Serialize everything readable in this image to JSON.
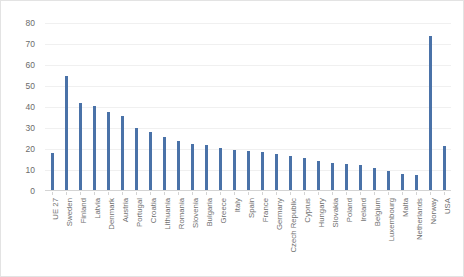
{
  "chart_data": {
    "type": "bar",
    "title": "",
    "subtitle": "",
    "xlabel": "",
    "ylabel": "",
    "ylim": [
      0,
      80
    ],
    "ytick_step": 10,
    "yticks": [
      "80",
      "70",
      "60",
      "50",
      "40",
      "30",
      "20",
      "10",
      "0"
    ],
    "grid": true,
    "legend": false,
    "bar_color": "#4a72a8",
    "gridline_color": "#f0f0f0",
    "axis_color": "#d4d4d4",
    "categories": [
      "UE 27",
      "Sweden",
      "Finland",
      "Latvia",
      "Denmark",
      "Austria",
      "Portugal",
      "Croatia",
      "Lithuania",
      "Romania",
      "Slovenia",
      "Bulgaria",
      "Greece",
      "Italy",
      "Spain",
      "France",
      "Germany",
      "Czech Republic",
      "Cyprus",
      "Hungary",
      "Slovakia",
      "Poland",
      "Ireland",
      "Belgium",
      "Luxembourg",
      "Malta",
      "Netherlands",
      "Norway",
      "USA"
    ],
    "values": [
      18,
      55,
      42,
      40.5,
      37.5,
      35.5,
      30,
      28,
      25.5,
      24,
      22.5,
      22,
      20.5,
      19.5,
      19,
      18.5,
      17.5,
      16.5,
      15.5,
      14.5,
      13.5,
      13,
      12.5,
      11,
      9.5,
      8,
      7.5,
      74,
      21.5
    ]
  }
}
